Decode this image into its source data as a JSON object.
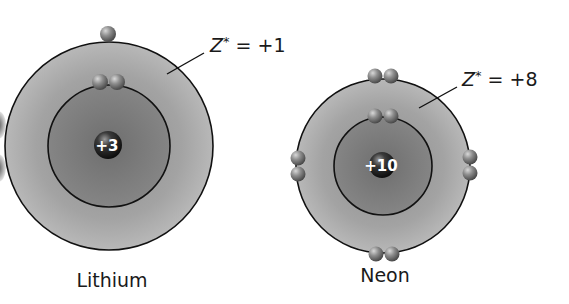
{
  "diagram": {
    "type": "atomic-shell-model",
    "atoms": [
      {
        "name": "Lithium",
        "nucleus_charge": "+3",
        "effective_charge_label": "Z* = +1",
        "z_symbol": "Z",
        "z_sup": "*",
        "z_value": " = +1",
        "inner_shell_electrons": 2,
        "outer_shell_electrons": 1
      },
      {
        "name": "Neon",
        "nucleus_charge": "+10",
        "effective_charge_label": "Z* = +8",
        "z_symbol": "Z",
        "z_sup": "*",
        "z_value": " = +8",
        "inner_shell_electrons": 2,
        "outer_shell_electrons": 8
      }
    ],
    "colors": {
      "outer_shell": "#9a9a9a",
      "inner_shell": "#7a7a7a",
      "shell_outline": "#111111",
      "electron": "#8a8a8a",
      "nucleus": "#1e1e1e",
      "background": "#ffffff"
    }
  }
}
